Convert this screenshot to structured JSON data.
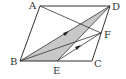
{
  "diagram": {
    "points": {
      "A": {
        "label": "A",
        "x": 40,
        "y": 6
      },
      "B": {
        "label": "B",
        "x": 20,
        "y": 61
      },
      "C": {
        "label": "C",
        "x": 92,
        "y": 61
      },
      "D": {
        "label": "D",
        "x": 110,
        "y": 6
      },
      "E": {
        "label": "E",
        "x": 57,
        "y": 61
      },
      "F": {
        "label": "F",
        "x": 101,
        "y": 33
      }
    },
    "segments": [
      [
        "A",
        "B"
      ],
      [
        "B",
        "C"
      ],
      [
        "C",
        "D"
      ],
      [
        "D",
        "A"
      ],
      [
        "A",
        "F"
      ],
      [
        "B",
        "D"
      ],
      [
        "B",
        "F"
      ],
      [
        "E",
        "F"
      ],
      [
        "E",
        "D"
      ]
    ],
    "shaded_region": [
      "B",
      "E",
      "D"
    ],
    "arrows": [
      {
        "on": [
          "B",
          "D"
        ],
        "direction": "toward D"
      },
      {
        "on": [
          "E",
          "F"
        ],
        "direction": "toward F"
      }
    ],
    "colors": {
      "stroke": "#333333",
      "shade": "#c8c8c8",
      "background": "#ffffff"
    }
  }
}
